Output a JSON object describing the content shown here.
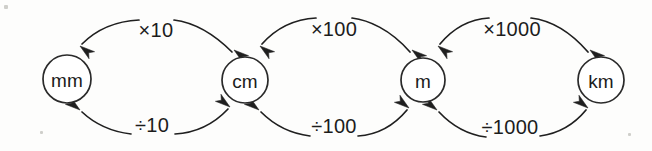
{
  "diagram": {
    "type": "flow-diagram",
    "background_color": "#fdfdfc",
    "ink_color": "#1f1f1f",
    "nodes": [
      {
        "id": "mm",
        "label": "mm",
        "cx": 67,
        "cy": 79,
        "r": 24
      },
      {
        "id": "cm",
        "label": "cm",
        "cx": 245,
        "cy": 80,
        "r": 23
      },
      {
        "id": "m",
        "label": "m",
        "cx": 423,
        "cy": 80,
        "r": 22
      },
      {
        "id": "km",
        "label": "km",
        "cx": 601,
        "cy": 80,
        "r": 23
      }
    ],
    "edges_top": [
      {
        "id": "cm-to-mm",
        "label": "×10",
        "from": "cm",
        "to": "mm",
        "direction": "right-to-left",
        "label_x": 156,
        "label_y": 30,
        "left_path": "M 232,52 C 210,30 190,22 174,20",
        "right_path": "M 139,20 C 118,21 98,28 82,44",
        "head_x": 80,
        "head_y": 46,
        "head_angle": 218,
        "mid_head_x": 234,
        "mid_head_y": 50,
        "mid_head_angle": 218
      },
      {
        "id": "m-to-cm",
        "label": "×100",
        "from": "m",
        "to": "cm",
        "direction": "right-to-left",
        "label_x": 334,
        "label_y": 29,
        "left_path": "M 410,52 C 390,29 368,20 352,18",
        "right_path": "M 316,18 C 297,19 278,26 262,44",
        "head_x": 260,
        "head_y": 46,
        "head_angle": 218,
        "mid_head_x": 412,
        "mid_head_y": 50,
        "mid_head_angle": 218
      },
      {
        "id": "km-to-m",
        "label": "×1000",
        "from": "km",
        "to": "m",
        "direction": "right-to-left",
        "label_x": 512,
        "label_y": 29,
        "left_path": "M 588,52 C 568,29 548,20 531,18",
        "right_path": "M 489,18 C 472,19 455,26 440,44",
        "head_x": 438,
        "head_y": 46,
        "head_angle": 218,
        "mid_head_x": 590,
        "mid_head_y": 50,
        "mid_head_angle": 218
      }
    ],
    "edges_bottom": [
      {
        "id": "mm-to-cm",
        "label": "÷10",
        "from": "mm",
        "to": "cm",
        "direction": "left-to-right",
        "label_x": 152,
        "label_y": 125,
        "left_path": "M 82,112 C 97,126 114,132 131,134",
        "right_path": "M 175,134 C 193,133 212,126 228,109",
        "head_x": 230,
        "head_y": 107,
        "head_angle": 38,
        "mid_head_x": 80,
        "mid_head_y": 110,
        "mid_head_angle": 38
      },
      {
        "id": "cm-to-m",
        "label": "÷100",
        "from": "cm",
        "to": "m",
        "direction": "left-to-right",
        "label_x": 334,
        "label_y": 126,
        "left_path": "M 261,112 C 277,128 294,134 310,136",
        "right_path": "M 358,136 C 374,135 392,128 407,110",
        "head_x": 409,
        "head_y": 108,
        "head_angle": 38,
        "mid_head_x": 259,
        "mid_head_y": 110,
        "mid_head_angle": 38
      },
      {
        "id": "m-to-km",
        "label": "÷1000",
        "from": "m",
        "to": "km",
        "direction": "left-to-right",
        "label_x": 510,
        "label_y": 127,
        "left_path": "M 439,112 C 454,128 470,135 486,137",
        "right_path": "M 540,136 C 555,134 572,127 586,110",
        "head_x": 588,
        "head_y": 108,
        "head_angle": 38,
        "mid_head_x": 437,
        "mid_head_y": 110,
        "mid_head_angle": 38
      }
    ]
  }
}
